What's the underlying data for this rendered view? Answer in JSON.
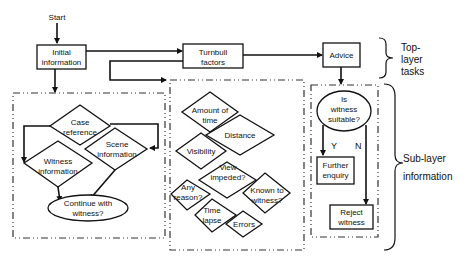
{
  "top": {
    "start": "Start",
    "initial": [
      "Initial",
      "information"
    ],
    "turnbull": [
      "Turnbull",
      "factors"
    ],
    "advice": "Advice"
  },
  "left_group": {
    "case": [
      "Case",
      "reference"
    ],
    "scene": [
      "Scene",
      "information"
    ],
    "witness": [
      "Witness",
      "information"
    ],
    "continue": [
      "Continue with",
      "witness?"
    ]
  },
  "mid_group": {
    "amount": [
      "Amount of",
      "time"
    ],
    "distance": "Distance",
    "visibility": "Visibility",
    "view": [
      "View",
      "impeded?"
    ],
    "reason": [
      "Any",
      "reason?"
    ],
    "known": [
      "Known to",
      "witness?"
    ],
    "lapse": [
      "Time",
      "lapse"
    ],
    "errors": "Errors"
  },
  "right_group": {
    "suitable": [
      "Is",
      "witness",
      "suitable?"
    ],
    "yes": "Y",
    "no": "N",
    "further": [
      "Further",
      "enquiry"
    ],
    "reject": [
      "Reject",
      "witness"
    ]
  },
  "braces": {
    "top": [
      "Top-",
      "layer",
      "tasks"
    ],
    "sub": [
      "Sub-layer",
      "information"
    ]
  }
}
